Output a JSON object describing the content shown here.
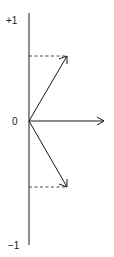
{
  "diagram": {
    "type": "phasor-vector-diagram",
    "axis": {
      "label_top": "+1",
      "label_origin": "0",
      "label_bottom": "−1"
    },
    "vectors": [
      {
        "name": "upper-vector",
        "direction": "up-right",
        "projection": "dashed line to vertical axis at about +0.55"
      },
      {
        "name": "horizontal-vector",
        "direction": "right",
        "projection": "none"
      },
      {
        "name": "lower-vector",
        "direction": "down-right",
        "projection": "dashed line to vertical axis at about -0.55"
      }
    ],
    "colors": {
      "stroke": "#1a1a1a",
      "background": "#ffffff"
    }
  }
}
